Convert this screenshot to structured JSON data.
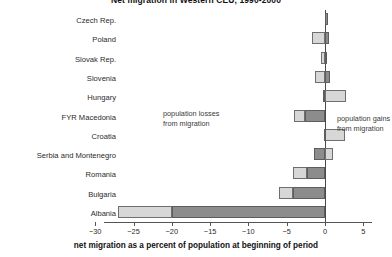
{
  "chart_data": {
    "type": "bar",
    "orientation": "horizontal",
    "stacked": true,
    "title": "Net migration in Western CEU, 1990-2000",
    "xlabel": "net migration as a percent of population at beginning of period",
    "ylabel": "",
    "xlim": [
      -30,
      6.5
    ],
    "xticks": [
      -30,
      -25,
      -20,
      -15,
      -10,
      -5,
      0,
      5
    ],
    "xtick_labels": [
      "−30",
      "−25",
      "−20",
      "−15",
      "−10",
      "−5",
      "0",
      "5"
    ],
    "grid": false,
    "legend_position": "none",
    "categories": [
      "Czech Rep.",
      "Poland",
      "Slovak Rep.",
      "Slovenia",
      "Hungary",
      "FYR Macedonia",
      "Croatia",
      "Serbia and Montenegro",
      "Romania",
      "Bulgaria",
      "Albania"
    ],
    "series": [
      {
        "name": "dark-segment",
        "color": "#8c8c8c",
        "values": [
          0.35,
          0.5,
          0.3,
          0.6,
          0.3,
          -2.6,
          1.2,
          1.0,
          -2.4,
          -4.2,
          -20.0
        ]
      },
      {
        "name": "light-segment",
        "color": "#d7d7d7",
        "values": [
          0.0,
          -1.7,
          -0.5,
          -1.3,
          2.7,
          -1.4,
          -2.6,
          -1.4,
          -1.8,
          -1.8,
          -7.0
        ]
      }
    ],
    "bars": [
      {
        "category": "Czech Rep.",
        "dark_from": 0.0,
        "dark_to": 0.35,
        "light_from": 0.0,
        "light_to": 0.0
      },
      {
        "category": "Poland",
        "dark_from": 0.0,
        "dark_to": 0.5,
        "light_from": -1.7,
        "light_to": 0.0
      },
      {
        "category": "Slovak Rep.",
        "dark_from": 0.0,
        "dark_to": 0.3,
        "light_from": -0.5,
        "light_to": 0.0
      },
      {
        "category": "Slovenia",
        "dark_from": 0.0,
        "dark_to": 0.6,
        "light_from": -1.3,
        "light_to": 0.0
      },
      {
        "category": "Hungary",
        "dark_from": -0.3,
        "dark_to": 0.0,
        "light_from": 0.0,
        "light_to": 2.7
      },
      {
        "category": "FYR Macedonia",
        "dark_from": -2.6,
        "dark_to": 0.0,
        "light_from": -4.0,
        "light_to": -2.6
      },
      {
        "category": "Croatia",
        "dark_from": -0.1,
        "dark_to": 0.0,
        "light_from": 0.0,
        "light_to": 2.6
      },
      {
        "category": "Serbia and Montenegro",
        "dark_from": -1.4,
        "dark_to": 0.0,
        "light_from": 0.0,
        "light_to": 1.0
      },
      {
        "category": "Romania",
        "dark_from": -2.4,
        "dark_to": 0.0,
        "light_from": -4.2,
        "light_to": -2.4
      },
      {
        "category": "Bulgaria",
        "dark_from": -4.2,
        "dark_to": 0.0,
        "light_from": -6.0,
        "light_to": -4.2
      },
      {
        "category": "Albania",
        "dark_from": -20.0,
        "dark_to": 0.0,
        "light_from": -27.0,
        "light_to": -20.0
      }
    ],
    "annotations": [
      {
        "id": "losses",
        "line1": "population losses",
        "line2": "from migration"
      },
      {
        "id": "gains",
        "line1": "population gains",
        "line2": "from migration"
      }
    ]
  }
}
